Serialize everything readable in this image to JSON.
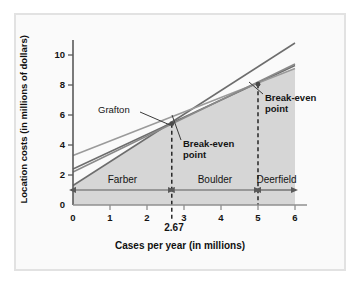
{
  "chart_data": {
    "type": "line",
    "title": "",
    "xlabel": "Cases per year (in millions)",
    "ylabel": "Location costs (in millions of dollars)",
    "xlim": [
      0,
      6.3
    ],
    "ylim": [
      0,
      11.3
    ],
    "xticks": [
      "0",
      "1",
      "2",
      "3",
      "4",
      "5",
      "6"
    ],
    "xtick_values": [
      0,
      1,
      2,
      3,
      4,
      5,
      6
    ],
    "yticks": [
      "0",
      "2",
      "4",
      "6",
      "8",
      "10"
    ],
    "ytick_values": [
      0,
      2,
      4,
      6,
      8,
      10
    ],
    "grid": false,
    "legend_position": "none",
    "series": [
      {
        "name": "Farber",
        "intercept": 1.3,
        "slope": 1.58,
        "x": [
          0,
          6
        ],
        "values": [
          1.3,
          10.8
        ],
        "color": "#6d6d6d"
      },
      {
        "name": "Boulder",
        "intercept": 2.4,
        "slope": 1.15,
        "x": [
          0,
          6
        ],
        "values": [
          2.4,
          9.3
        ],
        "color": "#6d6d6d"
      },
      {
        "name": "Deerfield",
        "intercept": 3.3,
        "slope": 0.97,
        "x": [
          0,
          6
        ],
        "values": [
          3.3,
          9.1
        ],
        "color": "#9a9a9a"
      },
      {
        "name": "Grafton",
        "intercept": 2.2,
        "slope": 1.2,
        "x": [
          0,
          6
        ],
        "values": [
          2.2,
          9.4
        ],
        "color": "#8a8a8a"
      }
    ],
    "annotations": [
      {
        "name": "grafton-label",
        "text": "Grafton",
        "x": 1.05,
        "y": 6.0
      },
      {
        "name": "break-even-label-1",
        "text_line1": "Break-even",
        "text_line2": "point",
        "x": 2.95,
        "y": 3.9
      },
      {
        "name": "break-even-label-2",
        "text_line1": "Break-even",
        "text_line2": "point",
        "x": 5.3,
        "y": 7.0
      }
    ],
    "break_even_points": [
      {
        "label": "2.67",
        "x": 2.67,
        "y": 5.42
      },
      {
        "label": "5",
        "x": 5.0,
        "y": 8.05
      }
    ],
    "regions": [
      {
        "label": "Farber",
        "from": 0,
        "to": 2.67
      },
      {
        "label": "Boulder",
        "from": 2.67,
        "to": 5.0
      },
      {
        "label": "Deerfield",
        "from": 5.0,
        "to": 6.0
      }
    ],
    "highlighted_x_label": "2.67",
    "shaded_region_color": "#cfcfcf"
  }
}
